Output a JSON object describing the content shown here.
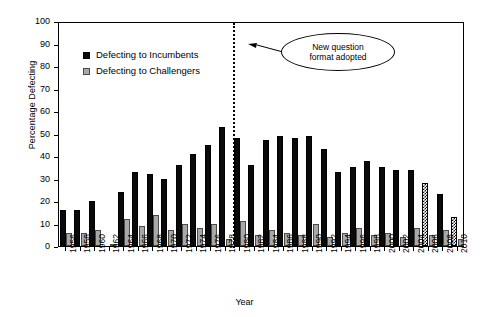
{
  "chart_data": {
    "type": "bar",
    "title": "",
    "xlabel": "Year",
    "ylabel": "Percentage Defecting",
    "ylim": [
      0,
      100
    ],
    "ytick_step": 10,
    "yticks": [
      0,
      10,
      20,
      30,
      40,
      50,
      60,
      70,
      80,
      90,
      100
    ],
    "grid": false,
    "legend_position": "upper-left-inside",
    "categories": [
      "1956",
      "1958",
      "1960",
      "1962",
      "1964",
      "1966",
      "1968",
      "1970",
      "1972",
      "1974",
      "1976",
      "1978",
      "1980",
      "1982",
      "1984",
      "1986",
      "1988",
      "1990",
      "1992",
      "1994",
      "1996",
      "1998",
      "2000",
      "2002",
      "2004",
      "2006",
      "2008",
      "2010"
    ],
    "series": [
      {
        "name": "Defecting to Incumbents",
        "color": "#0a0a0a",
        "values": [
          16,
          16,
          20,
          null,
          24,
          33,
          32,
          30,
          36,
          41,
          45,
          53,
          48,
          36,
          47,
          49,
          48,
          49,
          43,
          33,
          35,
          38,
          35,
          34,
          34,
          28,
          23,
          13
        ]
      },
      {
        "name": "Defecting to Challengers",
        "color": "#a8a8a8",
        "values": [
          6,
          6,
          7,
          1,
          12,
          9,
          14,
          7,
          10,
          8,
          10,
          3,
          11,
          5,
          7,
          6,
          5,
          10,
          4,
          6,
          8,
          5,
          6,
          4,
          8,
          5,
          7,
          3
        ]
      }
    ],
    "annotations": [
      {
        "name": "event-line",
        "type": "vertical-dashed-line",
        "at_category": "1978",
        "position_between": "1978 and 1980",
        "label": "New question format adopted",
        "label_lines": [
          "New question",
          "format adopted"
        ],
        "shape": "ellipse-callout-with-arrow"
      }
    ],
    "notes": {
      "hatched_bars": [
        "2006",
        "2010"
      ],
      "missing_incumbent_bar": "1962"
    }
  },
  "legend": {
    "items": [
      {
        "label": "Defecting to Incumbents",
        "swatch": "incumbent-swatch"
      },
      {
        "label": "Defecting to Challengers",
        "swatch": "challenger-swatch"
      }
    ]
  },
  "annotation": {
    "line1": "New question",
    "line2": "format adopted"
  },
  "axes": {
    "ylabel": "Percentage Defecting",
    "xlabel": "Year"
  }
}
